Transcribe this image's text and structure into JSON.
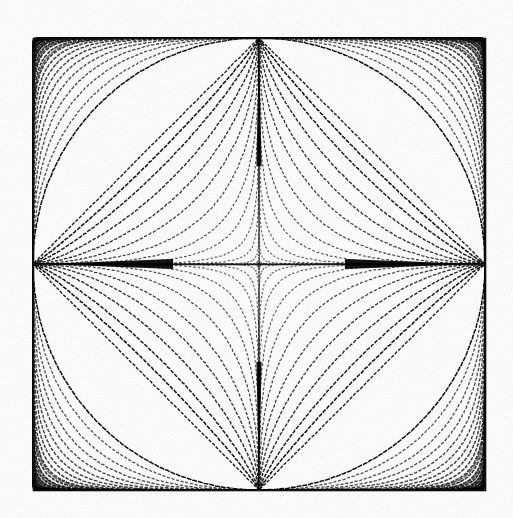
{
  "figure": {
    "background_color": "#ffffff",
    "stroke_color": "#000000",
    "frame": {
      "label": "plot-frame",
      "x_left_px": 33,
      "y_top_px": 38,
      "x_right_px": 485,
      "y_bottom_px": 490,
      "line_width_px": 1.6,
      "color": "#101010"
    },
    "axes": {
      "center_x_px": 259,
      "center_y_px": 264,
      "semi_axis_x_px": 226,
      "semi_axis_y_px": 226,
      "horizontal_axis_visible": true,
      "vertical_axis_visible": true,
      "horizontal_axis_color": "#1a1a1a",
      "vertical_axis_color": "#5a5a5a"
    }
  },
  "chart_data": {
    "type": "line",
    "subtitle": "|x/a|^n + |y/b|^n = 1",
    "xlabel": "",
    "ylabel": "",
    "xlim": [
      -1,
      1
    ],
    "ylim": [
      -1,
      1
    ],
    "grid": false,
    "legend_position": "none",
    "equation": "|x/a|^n + |y/b|^n = 1",
    "a": 1,
    "b": 1,
    "curve_parameter_name": "n",
    "annotations": [
      "Circle corresponds to n = 2",
      "Diamond corresponds to n = 1",
      "Astroid corresponds to n = 2/3",
      "Curves with n > 2 expand toward the square frame corners",
      "Curves with n < 1 form the concave four-pointed central star"
    ],
    "series": [
      {
        "name": "n = 0.10",
        "n": 0.1,
        "group": "inner-concave",
        "values": []
      },
      {
        "name": "n = 0.14",
        "n": 0.14,
        "group": "inner-concave",
        "values": []
      },
      {
        "name": "n = 0.18",
        "n": 0.18,
        "group": "inner-concave",
        "values": []
      },
      {
        "name": "n = 0.23",
        "n": 0.23,
        "group": "inner-concave",
        "values": []
      },
      {
        "name": "n = 0.28",
        "n": 0.28,
        "group": "inner-concave",
        "values": []
      },
      {
        "name": "n = 0.34",
        "n": 0.34,
        "group": "inner-concave",
        "values": []
      },
      {
        "name": "n = 0.40",
        "n": 0.4,
        "group": "inner-concave",
        "values": []
      },
      {
        "name": "n = 0.47",
        "n": 0.47,
        "group": "inner-concave",
        "values": []
      },
      {
        "name": "n = 0.55",
        "n": 0.55,
        "group": "inner-concave",
        "values": []
      },
      {
        "name": "n = 0.63",
        "n": 0.63,
        "group": "inner-concave",
        "values": []
      },
      {
        "name": "n = 0.72",
        "n": 0.72,
        "group": "inner-concave",
        "values": []
      },
      {
        "name": "n = 0.82",
        "n": 0.82,
        "group": "inner-concave",
        "values": []
      },
      {
        "name": "n = 0.91",
        "n": 0.91,
        "group": "inner-concave",
        "values": []
      },
      {
        "name": "n = 1.00",
        "n": 1.0,
        "group": "diamond",
        "values": []
      },
      {
        "name": "n = 2.00",
        "n": 2.0,
        "group": "circle",
        "values": []
      },
      {
        "name": "n = 2.30",
        "n": 2.3,
        "group": "outer-convex",
        "values": []
      },
      {
        "name": "n = 2.70",
        "n": 2.7,
        "group": "outer-convex",
        "values": []
      },
      {
        "name": "n = 3.15",
        "n": 3.15,
        "group": "outer-convex",
        "values": []
      },
      {
        "name": "n = 3.70",
        "n": 3.7,
        "group": "outer-convex",
        "values": []
      },
      {
        "name": "n = 4.35",
        "n": 4.35,
        "group": "outer-convex",
        "values": []
      },
      {
        "name": "n = 5.10",
        "n": 5.1,
        "group": "outer-convex",
        "values": []
      },
      {
        "name": "n = 6.00",
        "n": 6.0,
        "group": "outer-convex",
        "values": []
      },
      {
        "name": "n = 7.10",
        "n": 7.1,
        "group": "outer-convex",
        "values": []
      },
      {
        "name": "n = 8.40",
        "n": 8.4,
        "group": "outer-convex",
        "values": []
      },
      {
        "name": "n = 10.0",
        "n": 10.0,
        "group": "outer-convex",
        "values": []
      },
      {
        "name": "n = 12.0",
        "n": 12.0,
        "group": "outer-convex",
        "values": []
      },
      {
        "name": "n = 14.5",
        "n": 14.5,
        "group": "outer-convex",
        "values": []
      },
      {
        "name": "n = 17.5",
        "n": 17.5,
        "group": "outer-convex",
        "values": []
      },
      {
        "name": "n = 21.5",
        "n": 21.5,
        "group": "outer-convex",
        "values": []
      },
      {
        "name": "n = 27.0",
        "n": 27.0,
        "group": "outer-convex",
        "values": []
      },
      {
        "name": "n = 35.0",
        "n": 35.0,
        "group": "outer-convex",
        "values": []
      },
      {
        "name": "n = 48.0",
        "n": 48.0,
        "group": "outer-convex",
        "values": []
      },
      {
        "name": "n = 70.0",
        "n": 70.0,
        "group": "outer-convex",
        "values": []
      },
      {
        "name": "n = 120.0",
        "n": 120.0,
        "group": "outer-convex",
        "values": []
      }
    ]
  },
  "render": {
    "inner_curve_count": 13,
    "outer_curve_count": 19,
    "dash_segment_px": 3.1,
    "dash_gap_px": 1.5,
    "base_line_width_px": 1.45
  }
}
